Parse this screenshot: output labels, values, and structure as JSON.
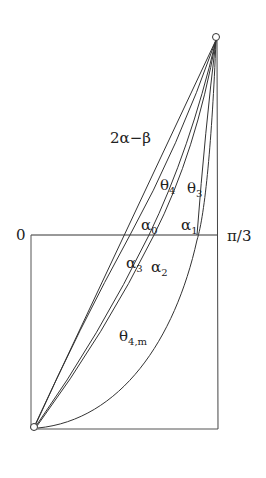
{
  "diagram": {
    "labels": {
      "origin": "0",
      "pi_third": "π/3",
      "two_alpha_minus_beta": "2α−β",
      "theta4": "θ",
      "theta4_sub": "4",
      "theta3": "θ",
      "theta3_sub": "3",
      "alpha0": "α",
      "alpha0_sub": "0",
      "alpha1": "α",
      "alpha1_sub": "1",
      "alpha2": "α",
      "alpha2_sub": "2",
      "alpha3": "α",
      "alpha3_sub": "3",
      "theta4m": "θ",
      "theta4m_sub": "4,m"
    },
    "points": {
      "top": {
        "x": 216,
        "y": 37
      },
      "bottom": {
        "x": 34,
        "y": 427
      }
    },
    "box": {
      "x1": 31,
      "y1": 235,
      "x2": 218,
      "y2": 429
    },
    "colors": {
      "stroke": "#333333",
      "background": "#ffffff"
    }
  }
}
